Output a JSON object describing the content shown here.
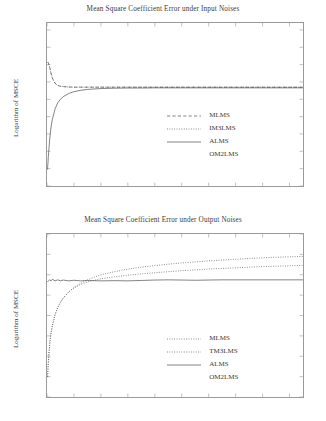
{
  "figure": {
    "width": 326,
    "height": 421,
    "background": "#ffffff",
    "line_color": "#4d4d4d",
    "axis_color": "#9a9a9a"
  },
  "charts": [
    {
      "id": "input-noises",
      "title": "Mean Square Coefficient Error under Input Noises",
      "xlabel": "",
      "ylabel": "Logarithm of MSCE",
      "xlim": [
        0,
        9.5
      ],
      "ylim": [
        -7,
        2.4
      ],
      "xticks": [
        0,
        1,
        2,
        3,
        4,
        5,
        6,
        7,
        8,
        9
      ],
      "yticks": [
        2,
        1,
        0,
        -1,
        -2,
        -3,
        -4,
        -5,
        -6,
        -7
      ],
      "grid": false,
      "legend_position": "center",
      "legend": [
        {
          "label": "MLMS",
          "style": "dashed"
        },
        {
          "label": "IM3LMS",
          "style": "dotted"
        },
        {
          "label": "ALMS",
          "style": "solid"
        },
        {
          "label": "OM2LMS",
          "style": "none"
        }
      ]
    },
    {
      "id": "output-noises",
      "title": "Mean Square Coefficient Error under Output Noises",
      "xlabel": "",
      "ylabel": "Logarithm of MSCE",
      "xlim": [
        0,
        9.5
      ],
      "ylim": [
        -10,
        -2
      ],
      "xticks": [
        0,
        1,
        2,
        3,
        4,
        5,
        6,
        7,
        8,
        9
      ],
      "yticks": [
        -2,
        -3,
        -4,
        -5,
        -6,
        -7,
        -8,
        -9,
        -10
      ],
      "grid": false,
      "legend_position": "center",
      "legend": [
        {
          "label": "MLMS",
          "style": "dotted"
        },
        {
          "label": "TM3LMS",
          "style": "dotted"
        },
        {
          "label": "ALMS",
          "style": "solid"
        },
        {
          "label": "OM2LMS",
          "style": "none"
        }
      ]
    }
  ],
  "chart_data": [
    {
      "type": "line",
      "title": "Mean Square Coefficient Error under Input Noises",
      "xlabel": "",
      "ylabel": "Logarithm of MSCE",
      "xlim": [
        0,
        9.5
      ],
      "ylim": [
        -7,
        2.4
      ],
      "xticks": [
        0,
        1,
        2,
        3,
        4,
        5,
        6,
        7,
        8,
        9
      ],
      "yticks": [
        2,
        1,
        0,
        -1,
        -2,
        -3,
        -4,
        -5,
        -6,
        -7
      ],
      "grid": false,
      "legend_position": "center",
      "x": [
        0.02,
        0.05,
        0.1,
        0.15,
        0.2,
        0.3,
        0.4,
        0.5,
        0.6,
        0.8,
        1.0,
        1.25,
        1.5,
        2.0,
        2.5,
        3.0,
        3.5,
        4.0,
        4.5,
        5.0,
        5.5,
        6.0,
        6.5,
        7.0,
        7.5,
        8.0,
        8.5,
        9.0,
        9.5
      ],
      "series": [
        {
          "name": "MLMS",
          "style": "dashed",
          "values": [
            0.15,
            0.1,
            -0.15,
            -0.5,
            -0.78,
            -1.08,
            -1.2,
            -1.25,
            -1.27,
            -1.29,
            -1.3,
            -1.3,
            -1.3,
            -1.3,
            -1.3,
            -1.3,
            -1.3,
            -1.3,
            -1.3,
            -1.3,
            -1.3,
            -1.3,
            -1.3,
            -1.3,
            -1.3,
            -1.3,
            -1.3,
            -1.3,
            -1.3
          ]
        },
        {
          "name": "IM3LMS",
          "style": "dotted",
          "values": [
            0.15,
            0.1,
            -0.15,
            -0.5,
            -0.78,
            -1.08,
            -1.2,
            -1.25,
            -1.27,
            -1.29,
            -1.3,
            -1.3,
            -1.3,
            -1.3,
            -1.3,
            -1.3,
            -1.3,
            -1.3,
            -1.3,
            -1.3,
            -1.3,
            -1.3,
            -1.3,
            -1.3,
            -1.3,
            -1.3,
            -1.3,
            -1.3,
            -1.3
          ]
        },
        {
          "name": "ALMS",
          "style": "solid",
          "values": [
            -6.05,
            -5.3,
            -4.3,
            -3.6,
            -3.15,
            -2.55,
            -2.2,
            -2.0,
            -1.85,
            -1.67,
            -1.56,
            -1.48,
            -1.43,
            -1.38,
            -1.36,
            -1.35,
            -1.35,
            -1.34,
            -1.34,
            -1.34,
            -1.34,
            -1.34,
            -1.34,
            -1.34,
            -1.34,
            -1.34,
            -1.34,
            -1.34,
            -1.34
          ]
        },
        {
          "name": "OM2LMS",
          "style": "none",
          "values": [
            -6.05,
            -5.3,
            -4.3,
            -3.6,
            -3.15,
            -2.55,
            -2.2,
            -2.0,
            -1.85,
            -1.67,
            -1.56,
            -1.48,
            -1.43,
            -1.38,
            -1.36,
            -1.35,
            -1.35,
            -1.34,
            -1.34,
            -1.34,
            -1.34,
            -1.34,
            -1.34,
            -1.34,
            -1.34,
            -1.34,
            -1.34,
            -1.34,
            -1.34
          ]
        }
      ]
    },
    {
      "type": "line",
      "title": "Mean Square Coefficient Error under Output Noises",
      "xlabel": "",
      "ylabel": "Logarithm of MSCE",
      "xlim": [
        0,
        9.5
      ],
      "ylim": [
        -10,
        -2
      ],
      "xticks": [
        0,
        1,
        2,
        3,
        4,
        5,
        6,
        7,
        8,
        9
      ],
      "yticks": [
        -2,
        -3,
        -4,
        -5,
        -6,
        -7,
        -8,
        -9,
        -10
      ],
      "grid": false,
      "legend_position": "center",
      "x": [
        0.02,
        0.05,
        0.1,
        0.15,
        0.2,
        0.3,
        0.4,
        0.5,
        0.6,
        0.8,
        1.0,
        1.25,
        1.5,
        2.0,
        2.5,
        3.0,
        3.5,
        4.0,
        4.5,
        5.0,
        5.5,
        6.0,
        6.5,
        7.0,
        7.5,
        8.0,
        8.5,
        9.0,
        9.5
      ],
      "series": [
        {
          "name": "MLMS",
          "style": "dotted",
          "values": [
            -9.0,
            -8.3,
            -7.4,
            -6.85,
            -6.5,
            -5.95,
            -5.6,
            -5.35,
            -5.15,
            -4.85,
            -4.62,
            -4.42,
            -4.25,
            -4.0,
            -3.85,
            -3.72,
            -3.63,
            -3.55,
            -3.48,
            -3.42,
            -3.37,
            -3.32,
            -3.28,
            -3.24,
            -3.2,
            -3.17,
            -3.14,
            -3.12,
            -3.1
          ]
        },
        {
          "name": "TM3LMS",
          "style": "dotted",
          "values": [
            -9.0,
            -8.3,
            -7.4,
            -6.85,
            -6.5,
            -5.95,
            -5.6,
            -5.35,
            -5.15,
            -4.85,
            -4.65,
            -4.48,
            -4.35,
            -4.2,
            -4.1,
            -4.02,
            -3.96,
            -3.9,
            -3.85,
            -3.8,
            -3.76,
            -3.72,
            -3.69,
            -3.66,
            -3.63,
            -3.6,
            -3.58,
            -3.56,
            -3.54
          ]
        },
        {
          "name": "ALMS",
          "style": "solid",
          "values": [
            -4.35,
            -4.3,
            -4.25,
            -4.3,
            -4.22,
            -4.3,
            -4.25,
            -4.3,
            -4.26,
            -4.3,
            -4.27,
            -4.3,
            -4.28,
            -4.3,
            -4.29,
            -4.3,
            -4.28,
            -4.26,
            -4.25,
            -4.26,
            -4.27,
            -4.26,
            -4.25,
            -4.25,
            -4.25,
            -4.25,
            -4.25,
            -4.25,
            -4.25
          ]
        },
        {
          "name": "OM2LMS",
          "style": "none",
          "values": [
            -9.0,
            -8.3,
            -7.4,
            -6.85,
            -6.5,
            -5.95,
            -5.6,
            -5.35,
            -5.15,
            -4.85,
            -4.65,
            -4.48,
            -4.35,
            -4.2,
            -4.1,
            -4.02,
            -3.96,
            -3.9,
            -3.85,
            -3.8,
            -3.76,
            -3.72,
            -3.69,
            -3.66,
            -3.63,
            -3.6,
            -3.58,
            -3.56,
            -3.54
          ]
        }
      ]
    }
  ]
}
